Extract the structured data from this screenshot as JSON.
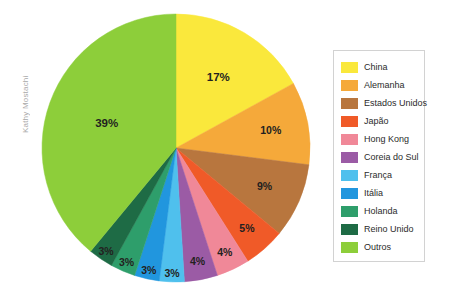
{
  "watermark": {
    "text": "Kathy Mostachi"
  },
  "legend": {
    "position": "right",
    "border_color": "#d2d2d2",
    "background": "#ffffff"
  },
  "chart_data": {
    "type": "pie",
    "title": "",
    "subtitle": "",
    "xlabel": "",
    "ylabel": "",
    "grid": false,
    "legend_position": "right",
    "start_angle_deg": 0,
    "direction": "clockwise",
    "label_format": "percent",
    "categories": [
      "China",
      "Alemanha",
      "Estados Unidos",
      "Japão",
      "Hong Kong",
      "Coreia do Sul",
      "França",
      "Itália",
      "Holanda",
      "Reino Unido",
      "Outros"
    ],
    "values": [
      17,
      10,
      9,
      5,
      4,
      4,
      3,
      3,
      3,
      3,
      39
    ],
    "value_labels": [
      "17%",
      "10%",
      "9%",
      "5%",
      "4%",
      "4%",
      "3%",
      "3%",
      "3%",
      "3%",
      "39%"
    ],
    "colors": [
      "#fae83c",
      "#f5a93a",
      "#b8763e",
      "#f05a28",
      "#f08898",
      "#9b5ba5",
      "#4fc0ed",
      "#2196de",
      "#2e9e6b",
      "#1e6b45",
      "#8dce3a"
    ],
    "slices": [
      {
        "label": "China",
        "value": 17,
        "display": "17%",
        "color": "#fae83c"
      },
      {
        "label": "Alemanha",
        "value": 10,
        "display": "10%",
        "color": "#f5a93a"
      },
      {
        "label": "Estados Unidos",
        "value": 9,
        "display": "9%",
        "color": "#b8763e"
      },
      {
        "label": "Japão",
        "value": 5,
        "display": "5%",
        "color": "#f05a28"
      },
      {
        "label": "Hong Kong",
        "value": 4,
        "display": "4%",
        "color": "#f08898"
      },
      {
        "label": "Coreia do Sul",
        "value": 4,
        "display": "4%",
        "color": "#9b5ba5"
      },
      {
        "label": "França",
        "value": 3,
        "display": "3%",
        "color": "#4fc0ed"
      },
      {
        "label": "Itália",
        "value": 3,
        "display": "3%",
        "color": "#2196de"
      },
      {
        "label": "Holanda",
        "value": 3,
        "display": "3%",
        "color": "#2e9e6b"
      },
      {
        "label": "Reino Unido",
        "value": 3,
        "display": "3%",
        "color": "#1e6b45"
      },
      {
        "label": "Outros",
        "value": 39,
        "display": "39%",
        "color": "#8dce3a"
      }
    ],
    "total": 100
  },
  "geometry": {
    "center_x": 176,
    "center_y": 148,
    "radius": 134
  }
}
